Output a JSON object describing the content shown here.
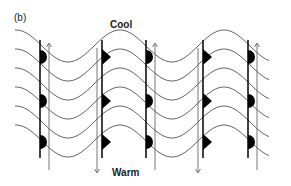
{
  "panel_label": "(b)",
  "labels": {
    "top": "Cool",
    "bottom": "Warm"
  },
  "colors": {
    "wave": "#555555",
    "front_line": "#111111",
    "arrow": "#666666",
    "front_symbol": "#000000"
  },
  "waves": {
    "count": 6,
    "description": "Sinusoidal isotherms, each line offset vertically"
  },
  "fronts": [
    {
      "x": 40,
      "type": "warm-front",
      "symbol": "semicircle",
      "arrow": "up"
    },
    {
      "x": 102,
      "type": "cold-front",
      "symbol": "triangle",
      "arrow": "down"
    },
    {
      "x": 146,
      "type": "warm-front",
      "symbol": "semicircle",
      "arrow": "up"
    },
    {
      "x": 203,
      "type": "cold-front",
      "symbol": "triangle",
      "arrow": "down"
    },
    {
      "x": 248,
      "type": "warm-front",
      "symbol": "semicircle",
      "arrow": "up"
    }
  ]
}
